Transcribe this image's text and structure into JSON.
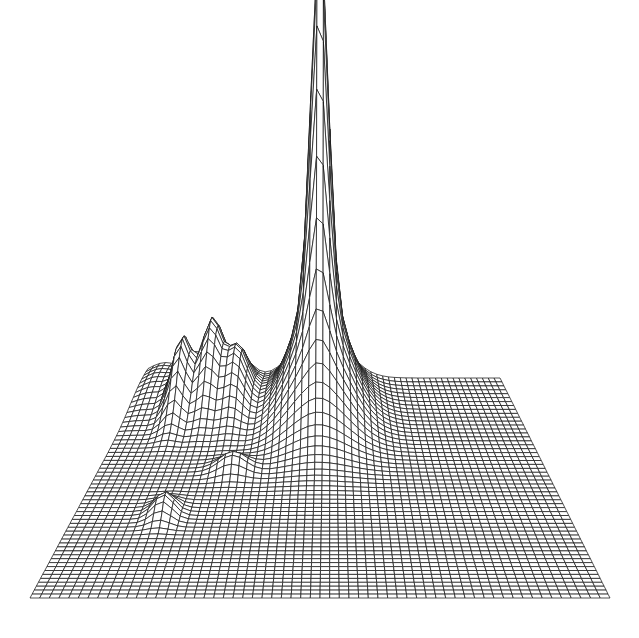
{
  "chart_data": {
    "type": "surface-3d-wireframe",
    "title": "",
    "xlabel": "",
    "ylabel": "",
    "zlabel": "",
    "grid": {
      "cols": 60,
      "rows": 56
    },
    "projection": {
      "back_left": [
        148,
        378
      ],
      "back_right": [
        500,
        378
      ],
      "front_left": [
        30,
        598
      ],
      "front_right": [
        610,
        598
      ],
      "z_scale_px": 350
    },
    "peaks": [
      {
        "name": "main-peak",
        "u": 0.49,
        "v": 0.12,
        "height": 1.0,
        "sigma_u": 0.022,
        "sigma_v": 0.06
      },
      {
        "name": "main-peak-base",
        "u": 0.49,
        "v": 0.16,
        "height": 0.35,
        "sigma_u": 0.07,
        "sigma_v": 0.12
      },
      {
        "name": "left-peak-1",
        "u": 0.2,
        "v": 0.1,
        "height": 0.22,
        "sigma_u": 0.025,
        "sigma_v": 0.08
      },
      {
        "name": "left-peak-2",
        "u": 0.13,
        "v": 0.14,
        "height": 0.19,
        "sigma_u": 0.022,
        "sigma_v": 0.07
      },
      {
        "name": "mid-peak",
        "u": 0.27,
        "v": 0.12,
        "height": 0.16,
        "sigma_u": 0.03,
        "sigma_v": 0.08
      },
      {
        "name": "small-front-peak",
        "u": 0.18,
        "v": 0.62,
        "height": 0.06,
        "sigma_u": 0.02,
        "sigma_v": 0.04
      },
      {
        "name": "ridge-left",
        "u": 0.05,
        "v": 0.05,
        "height": 0.05,
        "sigma_u": 0.05,
        "sigma_v": 0.1
      },
      {
        "name": "bump-center",
        "u": 0.3,
        "v": 0.42,
        "height": 0.05,
        "sigma_u": 0.03,
        "sigma_v": 0.03
      }
    ],
    "colors": {
      "line": "#1a1a1a",
      "fill": "#ffffff",
      "background": "#ffffff"
    }
  }
}
